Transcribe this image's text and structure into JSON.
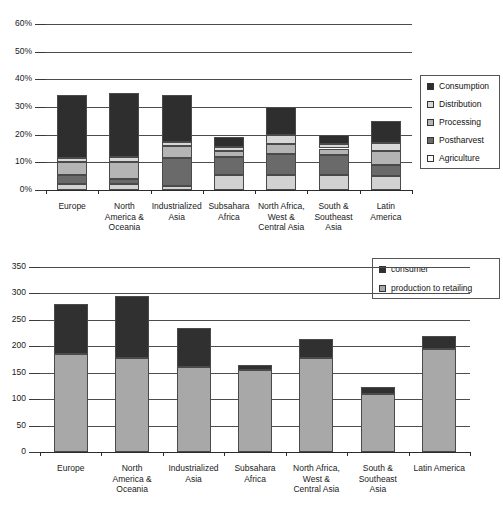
{
  "chart_data": [
    {
      "type": "bar",
      "id": "food-loss-share-by-stage",
      "stacked": true,
      "title": "",
      "xlabel": "",
      "ylabel": "",
      "ylim": [
        0,
        60
      ],
      "ytick_labels": [
        "0%",
        "10%",
        "20%",
        "30%",
        "40%",
        "50%",
        "60%"
      ],
      "ytick_values": [
        0,
        10,
        20,
        30,
        40,
        50,
        60
      ],
      "grid": true,
      "legend_position": "right",
      "categories": [
        "Europe",
        "North\nAmerica &\nOceania",
        "Industrialized\nAsia",
        "Subsahara\nAfrica",
        "North Africa,\nWest &\nCentral Asia",
        "South &\nSoutheast\nAsia",
        "Latin\nAmerica"
      ],
      "series": [
        {
          "name": "Agriculture",
          "color": "#d2d2d2",
          "values": [
            2.0,
            2.0,
            1.5,
            5.5,
            5.5,
            5.5,
            5.0
          ]
        },
        {
          "name": "Postharvest",
          "color": "#6a6a6a",
          "values": [
            3.5,
            2.0,
            10.0,
            6.5,
            7.5,
            7.0,
            4.0
          ]
        },
        {
          "name": "Processing",
          "color": "#b4b4b4",
          "values": [
            4.5,
            6.0,
            4.5,
            2.0,
            3.5,
            2.5,
            5.0
          ]
        },
        {
          "name": "Distribution",
          "color": "#d8d8d8",
          "values": [
            1.5,
            2.0,
            1.5,
            1.5,
            3.5,
            1.5,
            3.0
          ]
        },
        {
          "name": "Consumption",
          "color": "#2e2e2e",
          "values": [
            23.0,
            23.0,
            17.0,
            3.5,
            10.0,
            3.5,
            8.0
          ]
        }
      ],
      "totals": [
        34.5,
        35.0,
        34.5,
        19.0,
        30.0,
        20.0,
        25.0
      ]
    },
    {
      "type": "bar",
      "id": "per-capita-food-loss",
      "stacked": true,
      "title": "",
      "xlabel": "",
      "ylabel": "",
      "ylim": [
        0,
        350
      ],
      "ytick_labels": [
        "0",
        "50",
        "100",
        "150",
        "200",
        "250",
        "300",
        "350"
      ],
      "ytick_values": [
        0,
        50,
        100,
        150,
        200,
        250,
        300,
        350
      ],
      "grid": true,
      "legend_position": "top-right",
      "categories": [
        "Europe",
        "North\nAmerica &\nOceania",
        "Industrialized\nAsia",
        "Subsahara\nAfrica",
        "North Africa,\nWest &\nCentral Asia",
        "South &\nSoutheast\nAsia",
        "Latin America"
      ],
      "series": [
        {
          "name": "production to retailing",
          "color": "#a8a8a8",
          "values": [
            185,
            178,
            160,
            155,
            178,
            110,
            195
          ]
        },
        {
          "name": "consumer",
          "color": "#303030",
          "values": [
            95,
            117,
            75,
            10,
            35,
            13,
            25
          ]
        }
      ],
      "totals": [
        280,
        295,
        235,
        165,
        213,
        123,
        220
      ]
    }
  ],
  "legends": {
    "top": {
      "items": [
        {
          "label": "Consumption",
          "color": "#2e2e2e"
        },
        {
          "label": "Distribution",
          "color": "#d8d8d8"
        },
        {
          "label": "Processing",
          "color": "#b4b4b4"
        },
        {
          "label": "Postharvest",
          "color": "#6a6a6a"
        },
        {
          "label": "Agriculture",
          "color": "#fafafa"
        }
      ]
    },
    "bottom": {
      "items": [
        {
          "label": "consumer",
          "color": "#303030"
        },
        {
          "label": "production to retailing",
          "color": "#a8a8a8"
        }
      ]
    }
  }
}
